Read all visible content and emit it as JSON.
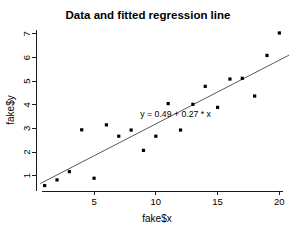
{
  "chart_data": {
    "type": "scatter",
    "title": "Data and fitted regression line",
    "xlabel": "fake$x",
    "ylabel": "fake$y",
    "xlim": [
      0.3,
      20.7
    ],
    "ylim": [
      0.35,
      7.25
    ],
    "xticks": [
      5,
      10,
      15,
      20
    ],
    "yticks": [
      1,
      2,
      3,
      4,
      5,
      6,
      7
    ],
    "grid": false,
    "legend": null,
    "x": [
      1,
      2,
      3,
      4,
      5,
      6,
      7,
      8,
      9,
      10,
      11,
      12,
      13,
      14,
      15,
      16,
      17,
      18,
      19,
      20
    ],
    "y": [
      0.58,
      0.82,
      1.17,
      2.94,
      0.89,
      3.15,
      2.67,
      2.93,
      2.07,
      2.67,
      4.05,
      2.93,
      4.02,
      4.78,
      3.89,
      5.09,
      5.12,
      4.37,
      6.09,
      7.04
    ],
    "point_label": "data-point",
    "fit": {
      "intercept": 0.49,
      "slope": 0.27,
      "annotation": "y = 0.49 + 0.27 * x",
      "annotation_x": 11.6,
      "annotation_y": 3.48,
      "line_color": "#3a3a3a"
    },
    "point_color": "#000000",
    "background_color": "#ffffff",
    "axis_color": "#000000"
  }
}
